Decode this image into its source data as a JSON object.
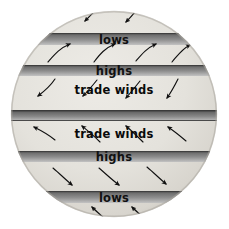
{
  "figure": {
    "shape": "circle",
    "diameter_px": 206,
    "center": {
      "x": 114,
      "y": 114
    },
    "colors": {
      "page_background": "#ffffff",
      "globe_light": "#e6e4df",
      "globe_shadow_edge": "#b8b5ae",
      "band_dark": "#6d6d6d",
      "band_mid": "#8d8d8d",
      "band_light": "#b9b9b9",
      "arrow": "#111111",
      "label_text": "#0a0a0a"
    }
  },
  "bands": [
    {
      "id": "band-lows-north",
      "label": "lows",
      "y": 33,
      "height": 12,
      "labeled": true,
      "full_width": false
    },
    {
      "id": "band-highs-north",
      "label": "highs",
      "y": 65,
      "height": 11,
      "labeled": true,
      "full_width": false
    },
    {
      "id": "band-equator",
      "label": "",
      "y": 110,
      "height": 11,
      "labeled": false,
      "full_width": true
    },
    {
      "id": "band-highs-south",
      "label": "highs",
      "y": 151,
      "height": 11,
      "labeled": true,
      "full_width": false
    },
    {
      "id": "band-lows-south",
      "label": "lows",
      "y": 191,
      "height": 12,
      "labeled": true,
      "full_width": false
    }
  ],
  "free_labels": [
    {
      "id": "label-trade-winds-north",
      "text": "trade winds",
      "x": 114,
      "y": 90
    },
    {
      "id": "label-trade-winds-south",
      "text": "trade winds",
      "x": 114,
      "y": 134
    }
  ],
  "wind_zones": [
    {
      "id": "zone-polar-easterlies-north",
      "name": "polar easterlies north",
      "direction": "down-left",
      "arrow_count": 2
    },
    {
      "id": "zone-westerlies-north",
      "name": "westerlies north",
      "direction": "up-right",
      "arrow_count": 4
    },
    {
      "id": "zone-trade-winds-north",
      "name": "northeast trade winds",
      "direction": "down-left",
      "arrow_count": 4
    },
    {
      "id": "zone-trade-winds-south",
      "name": "southeast trade winds",
      "direction": "up-left",
      "arrow_count": 4
    },
    {
      "id": "zone-westerlies-south",
      "name": "westerlies south",
      "direction": "down-right",
      "arrow_count": 3
    },
    {
      "id": "zone-polar-easterlies-south",
      "name": "polar easterlies south",
      "direction": "up-right",
      "arrow_count": 2
    }
  ],
  "labels": {
    "lows_north": "lows",
    "highs_north": "highs",
    "highs_south": "highs",
    "lows_south": "lows",
    "trade_winds_north": "trade winds",
    "trade_winds_south": "trade winds"
  }
}
